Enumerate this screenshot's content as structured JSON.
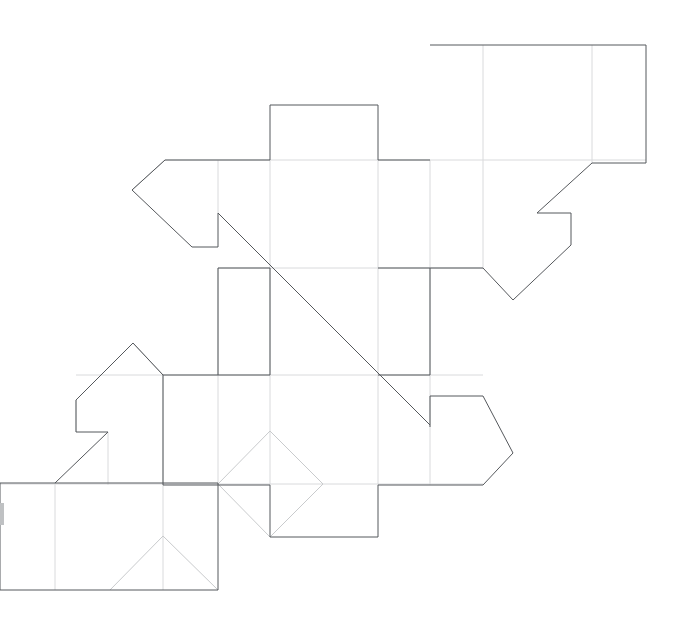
{
  "document": {
    "kind": "technical-line-drawing",
    "subject": "packaging dieline / unfolded carton net",
    "width": 682,
    "height": 629,
    "background_color": "#ffffff"
  },
  "colors": {
    "cut_line": "#55585c",
    "fold_line": "#d9dadc",
    "score_line": "#c9cbcd",
    "edge_mark": "#bfc1c3",
    "background": "#ffffff"
  },
  "line_weights": {
    "cut_line": 1,
    "fold_line": 1,
    "score_line": 1
  },
  "geometry": {
    "cut_outline": {
      "label": "main-die-cut-outline",
      "closed": true,
      "points": [
        [
          430,
          45
        ],
        [
          646,
          45
        ],
        [
          646,
          163
        ],
        [
          592,
          163
        ],
        [
          537,
          213
        ],
        [
          571,
          213
        ],
        [
          571,
          245
        ],
        [
          513,
          300
        ],
        [
          483,
          268
        ],
        [
          430,
          268
        ],
        [
          430,
          375
        ],
        [
          483,
          375
        ],
        [
          483,
          396
        ],
        [
          430,
          396
        ],
        [
          430,
          427
        ],
        [
          404,
          400
        ],
        [
          218,
          213
        ],
        [
          218,
          247
        ],
        [
          192,
          247
        ],
        [
          132,
          190
        ],
        [
          165,
          160
        ],
        [
          270,
          160
        ],
        [
          270,
          105
        ],
        [
          378,
          105
        ],
        [
          378,
          160
        ],
        [
          430,
          160
        ]
      ]
    },
    "cut_paths": [
      {
        "label": "top-tab-and-upper-band",
        "d": "M 430 45 L 646 45 L 646 163 L 592 163 L 537 213 L 571 213 L 571 245 L 513 300 L 483 268 L 430 268"
      },
      {
        "label": "upper-left-arrow-flap",
        "d": "M 430 160 L 378 160 L 378 105 L 270 105 L 270 160 L 165 160 L 132 190 L 192 247 L 218 247 L 218 213"
      },
      {
        "label": "central-long-diagonal",
        "d": "M 218 213 L 430 425"
      },
      {
        "label": "mid-left-panel",
        "d": "M 218 268 L 270 268 L 270 375 L 218 375 L 218 268"
      },
      {
        "label": "mid-right-panel",
        "d": "M 378 268 L 430 268 L 430 375 L 378 375"
      },
      {
        "label": "right-arrow-tab",
        "d": "M 430 427 L 430 396 L 483 396 L 513 453 L 483 485"
      },
      {
        "label": "lower-band-outline",
        "d": "M 483 485 L 378 485 L 378 537 L 270 537 L 270 485 L 163 485 L 163 375 L 218 375"
      },
      {
        "label": "lower-left-arrow-flap",
        "d": "M 163 375 L 133 343 L 76 400 L 76 432 L 108 432 L 55 483"
      },
      {
        "label": "bottom-left-rectangle",
        "d": "M 55 483 L 0 483 L 0 590 L 218 590 L 218 483 L 55 483"
      }
    ],
    "fold_lines": [
      {
        "label": "fold-top-rect-left",
        "d": "M 483 45 L 483 163"
      },
      {
        "label": "fold-top-rect-right",
        "d": "M 592 45 L 592 163"
      },
      {
        "label": "fold-upper-band-top",
        "d": "M 165 160 L 646 160"
      },
      {
        "label": "fold-vertical-x218-upper",
        "d": "M 218 160 L 218 213"
      },
      {
        "label": "fold-vertical-x270-upper",
        "d": "M 270 160 L 270 268"
      },
      {
        "label": "fold-vertical-x378-upper",
        "d": "M 378 160 L 378 268"
      },
      {
        "label": "fold-vertical-x430-upper",
        "d": "M 430 160 L 430 268"
      },
      {
        "label": "fold-vertical-x483-upper",
        "d": "M 483 163 L 483 268"
      },
      {
        "label": "fold-band-divider-y268",
        "d": "M 218 268 L 483 268"
      },
      {
        "label": "fold-band-divider-y375",
        "d": "M 76 375 L 483 375"
      },
      {
        "label": "fold-vertical-x218-mid",
        "d": "M 218 268 L 218 485"
      },
      {
        "label": "fold-vertical-x270-mid",
        "d": "M 270 268 L 270 485"
      },
      {
        "label": "fold-vertical-x378-mid",
        "d": "M 378 268 L 378 485"
      },
      {
        "label": "fold-vertical-x430-mid",
        "d": "M 430 268 L 430 485"
      },
      {
        "label": "fold-vertical-x163-lower",
        "d": "M 163 375 L 163 590"
      },
      {
        "label": "fold-band-divider-y485",
        "d": "M 0 484 L 483 484"
      },
      {
        "label": "fold-vertical-x55-bottom",
        "d": "M 55 483 L 55 590"
      },
      {
        "label": "fold-vertical-x108-bottom",
        "d": "M 108 432 L 108 485"
      },
      {
        "label": "fold-vertical-x76-bottom",
        "d": "M 76 400 L 76 432"
      }
    ],
    "score_lines": [
      {
        "label": "score-diamond-upper-left",
        "d": "M 218 484 L 270 431"
      },
      {
        "label": "score-diamond-upper-right",
        "d": "M 270 431 L 323 484"
      },
      {
        "label": "score-diamond-lower-right",
        "d": "M 323 484 L 270 537"
      },
      {
        "label": "score-diamond-lower-left",
        "d": "M 270 537 L 218 484"
      },
      {
        "label": "score-triangle-left",
        "d": "M 110 590 L 163 536"
      },
      {
        "label": "score-triangle-right",
        "d": "M 163 536 L 218 590"
      },
      {
        "label": "score-arrow-left-upper",
        "d": "M 132 190 L 165 160"
      },
      {
        "label": "score-lower-flap-apex-right",
        "d": "M 133 343 L 163 375"
      }
    ],
    "key_vertices": {
      "top_rect_top_left": [
        430,
        45
      ],
      "top_rect_top_right": [
        646,
        45
      ],
      "top_rect_bottom_right": [
        646,
        163
      ],
      "right_flap_notch_left": [
        537,
        213
      ],
      "right_flap_notch_right": [
        571,
        213
      ],
      "right_v_bottom": [
        513,
        300
      ],
      "top_tab_left": [
        270,
        105
      ],
      "top_tab_right": [
        378,
        105
      ],
      "left_arrow_point": [
        132,
        190
      ],
      "left_notch_corner": [
        218,
        213
      ],
      "diagonal_end": [
        430,
        425
      ],
      "right_arrow_point": [
        513,
        453
      ],
      "lower_left_arrow_apex": [
        133,
        343
      ],
      "lower_left_arrow_point": [
        55,
        483
      ],
      "bottom_rect_bottom_right": [
        218,
        590
      ],
      "triangle_apex": [
        163,
        536
      ],
      "diamond_apex": [
        270,
        431
      ]
    },
    "edge_marks": [
      {
        "label": "left-edge-artifact",
        "x": 0,
        "y": 503,
        "width": 4,
        "height": 22
      }
    ]
  }
}
